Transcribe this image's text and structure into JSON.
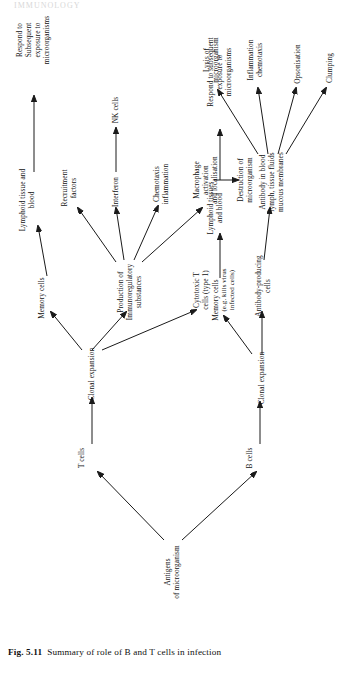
{
  "figure": {
    "caption_label": "Fig. 5.11",
    "caption_text": "Summary of role of B and T cells in infection",
    "bleed_text": "IMMUNOLOGY"
  },
  "nodes": {
    "antigens": "Antigens\nof microorganism",
    "t_cells": "T cells",
    "t_clonal": "Clonal expansion",
    "t_memory": "Memory cells",
    "t_lymphoid": "Lymphoid tissue and\nblood",
    "t_respond": "Respond to Subsequent\nexposure to microorganisms",
    "production": "Production of\nImmunoregulatory\nsubstances",
    "recruitment": "Recruitment\nfactors",
    "interferon": "Interferon",
    "nk_cells": "NK cells",
    "chemotaxis": "Chemotaxis\ninflammation",
    "macrophage": "Macrophage\nactivation\nand localisation",
    "destruction": "Destruction of\nmicroorganism",
    "cytotoxic": "Cytotoxic T\ncells (type 1)",
    "cytotoxic_note": "(e.g. kills virus\ninfected cells)",
    "b_cells": "B cells",
    "b_clonal": "Clonal expansion",
    "b_memory": "Memory cells",
    "b_lymphoid": "Lymphoid tissues\nand blood",
    "b_respond": "Respond to subsequent\nexposure to microorganisms",
    "antibody_cells": "Antibody-producing\ncells",
    "antibody_fluids": "Antibody in blood\nlymph, tissue fluids\nmucous membranes",
    "lysis": "Lysis of\nmicroorganism",
    "inflammation": "Inflammation\nchemotaxis",
    "opsonisation": "Opsonisation",
    "clumping": "Clumping"
  }
}
